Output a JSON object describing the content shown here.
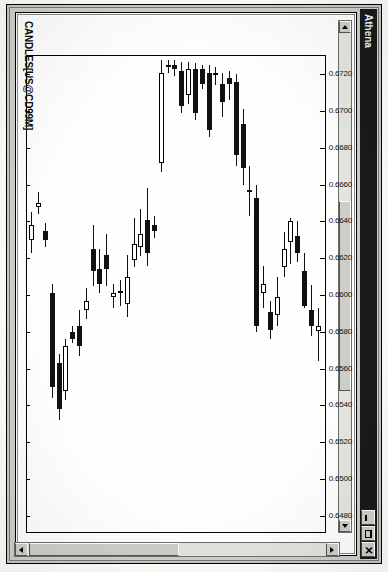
{
  "window": {
    "title": "Athena",
    "buttons": [
      {
        "name": "minimize",
        "label": "_"
      },
      {
        "name": "maximize",
        "label": "□"
      },
      {
        "name": "close",
        "label": "✕"
      }
    ]
  },
  "scrollbars": {
    "vertical": {
      "up_label": "▲",
      "down_label": "▼"
    },
    "horizontal": {
      "left_label": "◀",
      "right_label": "▶"
    }
  },
  "chart_window": {
    "caption": "CANDLES[US@CD99M]"
  },
  "chart_data": {
    "type": "candlestick",
    "title": "CANDLES[US@CD99M]",
    "xlabel": "",
    "ylabel": "",
    "grid": false,
    "legend": null,
    "orientation": "rotated-90-cw",
    "axis_labels_side": "left",
    "ylim": [
      0.647,
      0.673
    ],
    "yticks": [
      0.672,
      0.67,
      0.668,
      0.666,
      0.664,
      0.662,
      0.66,
      0.658,
      0.656,
      0.654,
      0.652,
      0.65,
      0.648
    ],
    "ytick_labels": [
      "0.6720",
      "0.6700",
      "0.6680",
      "0.6660",
      "0.6640",
      "0.6620",
      "0.6600",
      "0.6580",
      "0.6560",
      "0.6540",
      "0.6520",
      "0.6500",
      "0.6480"
    ],
    "up_color": "#ffffff",
    "down_color": "#111111",
    "candles": [
      {
        "i": 0,
        "open": 0.65805,
        "high": 0.6593,
        "low": 0.6564,
        "close": 0.6583,
        "dir": "up"
      },
      {
        "i": 1,
        "open": 0.6592,
        "high": 0.66055,
        "low": 0.65775,
        "close": 0.6583,
        "dir": "down"
      },
      {
        "i": 2,
        "open": 0.6613,
        "high": 0.6623,
        "low": 0.6593,
        "close": 0.6594,
        "dir": "down"
      },
      {
        "i": 3,
        "open": 0.6632,
        "high": 0.664,
        "low": 0.6618,
        "close": 0.6623,
        "dir": "down"
      },
      {
        "i": 4,
        "open": 0.6629,
        "high": 0.6642,
        "low": 0.6617,
        "close": 0.664,
        "dir": "up"
      },
      {
        "i": 5,
        "open": 0.6615,
        "high": 0.6634,
        "low": 0.661,
        "close": 0.6625,
        "dir": "up"
      },
      {
        "i": 6,
        "open": 0.6599,
        "high": 0.661,
        "low": 0.6583,
        "close": 0.6589,
        "dir": "up"
      },
      {
        "i": 7,
        "open": 0.6591,
        "high": 0.6597,
        "low": 0.6576,
        "close": 0.6581,
        "dir": "down"
      },
      {
        "i": 8,
        "open": 0.6606,
        "high": 0.6616,
        "low": 0.6593,
        "close": 0.6601,
        "dir": "up"
      },
      {
        "i": 9,
        "open": 0.6653,
        "high": 0.666,
        "low": 0.658,
        "close": 0.6583,
        "dir": "down"
      },
      {
        "i": 10,
        "open": 0.6657,
        "high": 0.667,
        "low": 0.6643,
        "close": 0.6656,
        "dir": "down"
      },
      {
        "i": 11,
        "open": 0.6693,
        "high": 0.6701,
        "low": 0.666,
        "close": 0.6669,
        "dir": "down"
      },
      {
        "i": 12,
        "open": 0.6716,
        "high": 0.672,
        "low": 0.667,
        "close": 0.6676,
        "dir": "down"
      },
      {
        "i": 13,
        "open": 0.6718,
        "high": 0.6722,
        "low": 0.6706,
        "close": 0.6715,
        "dir": "down"
      },
      {
        "i": 14,
        "open": 0.6705,
        "high": 0.6721,
        "low": 0.6697,
        "close": 0.6715,
        "dir": "down"
      },
      {
        "i": 15,
        "open": 0.6721,
        "high": 0.6724,
        "low": 0.6714,
        "close": 0.672,
        "dir": "up"
      },
      {
        "i": 16,
        "open": 0.6721,
        "high": 0.6725,
        "low": 0.6686,
        "close": 0.669,
        "dir": "down"
      },
      {
        "i": 17,
        "open": 0.6723,
        "high": 0.6725,
        "low": 0.6712,
        "close": 0.6715,
        "dir": "down"
      },
      {
        "i": 18,
        "open": 0.6723,
        "high": 0.6726,
        "low": 0.6695,
        "close": 0.6699,
        "dir": "down"
      },
      {
        "i": 19,
        "open": 0.6723,
        "high": 0.6727,
        "low": 0.6704,
        "close": 0.6709,
        "dir": "up"
      },
      {
        "i": 20,
        "open": 0.6722,
        "high": 0.6727,
        "low": 0.6699,
        "close": 0.6703,
        "dir": "down"
      },
      {
        "i": 21,
        "open": 0.6725,
        "high": 0.6728,
        "low": 0.6719,
        "close": 0.6723,
        "dir": "down"
      },
      {
        "i": 22,
        "open": 0.6725,
        "high": 0.6728,
        "low": 0.6721,
        "close": 0.6725,
        "dir": "down"
      },
      {
        "i": 23,
        "open": 0.6721,
        "high": 0.6728,
        "low": 0.6667,
        "close": 0.6672,
        "dir": "up"
      },
      {
        "i": 24,
        "open": 0.6638,
        "high": 0.6643,
        "low": 0.6631,
        "close": 0.6635,
        "dir": "down"
      },
      {
        "i": 25,
        "open": 0.6641,
        "high": 0.6658,
        "low": 0.6616,
        "close": 0.6623,
        "dir": "down"
      },
      {
        "i": 26,
        "open": 0.6633,
        "high": 0.6647,
        "low": 0.6621,
        "close": 0.6626,
        "dir": "up"
      },
      {
        "i": 27,
        "open": 0.6628,
        "high": 0.6642,
        "low": 0.6615,
        "close": 0.6619,
        "dir": "up"
      },
      {
        "i": 28,
        "open": 0.661,
        "high": 0.6622,
        "low": 0.6588,
        "close": 0.6595,
        "dir": "up"
      },
      {
        "i": 29,
        "open": 0.6602,
        "high": 0.6608,
        "low": 0.6594,
        "close": 0.6601,
        "dir": "up"
      },
      {
        "i": 30,
        "open": 0.6601,
        "high": 0.6606,
        "low": 0.6593,
        "close": 0.6599,
        "dir": "up"
      },
      {
        "i": 31,
        "open": 0.6622,
        "high": 0.6633,
        "low": 0.6605,
        "close": 0.6614,
        "dir": "down"
      },
      {
        "i": 32,
        "open": 0.6614,
        "high": 0.6625,
        "low": 0.6601,
        "close": 0.6606,
        "dir": "down"
      },
      {
        "i": 33,
        "open": 0.6625,
        "high": 0.6638,
        "low": 0.6605,
        "close": 0.6613,
        "dir": "down"
      },
      {
        "i": 34,
        "open": 0.6597,
        "high": 0.6604,
        "low": 0.6587,
        "close": 0.6592,
        "dir": "up"
      },
      {
        "i": 35,
        "open": 0.6583,
        "high": 0.6592,
        "low": 0.6567,
        "close": 0.6572,
        "dir": "down"
      },
      {
        "i": 36,
        "open": 0.658,
        "high": 0.6583,
        "low": 0.6574,
        "close": 0.6576,
        "dir": "down"
      },
      {
        "i": 37,
        "open": 0.6572,
        "high": 0.6576,
        "low": 0.6543,
        "close": 0.6548,
        "dir": "up"
      },
      {
        "i": 38,
        "open": 0.6563,
        "high": 0.6568,
        "low": 0.6532,
        "close": 0.6538,
        "dir": "down"
      },
      {
        "i": 39,
        "open": 0.6601,
        "high": 0.6606,
        "low": 0.6544,
        "close": 0.655,
        "dir": "down"
      },
      {
        "i": 40,
        "open": 0.6635,
        "high": 0.6639,
        "low": 0.6626,
        "close": 0.663,
        "dir": "down"
      },
      {
        "i": 41,
        "open": 0.665,
        "high": 0.6656,
        "low": 0.6644,
        "close": 0.6648,
        "dir": "up"
      },
      {
        "i": 42,
        "open": 0.6638,
        "high": 0.6645,
        "low": 0.6623,
        "close": 0.663,
        "dir": "up"
      }
    ]
  }
}
